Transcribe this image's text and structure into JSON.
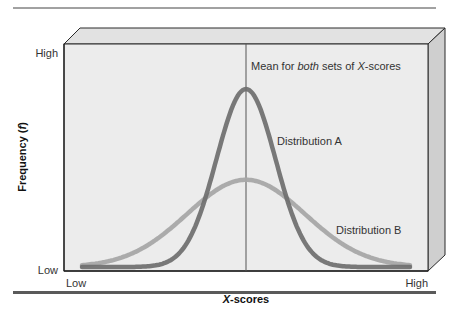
{
  "figure": {
    "top_rule": true,
    "bottom_rule": true
  },
  "chart_data": {
    "type": "line",
    "title": "",
    "xlabel": "X-scores",
    "xlabel_italic_part": "X",
    "xlabel_rest": "-scores",
    "ylabel": "Frequency (f)",
    "ylabel_prefix": "Frequency (",
    "ylabel_italic": "f",
    "ylabel_suffix": ")",
    "x_ticks": [
      "Low",
      "High"
    ],
    "y_ticks": [
      "Low",
      "High"
    ],
    "grid": false,
    "legend_position": "inline annotations",
    "annotations": {
      "mean_line": {
        "text_pre": "Mean for ",
        "text_italic": "both",
        "text_mid": " sets of ",
        "text_italic2": "X",
        "text_post": "-scores",
        "full_text": "Mean for both sets of X-scores",
        "x": 0.5
      }
    },
    "series": [
      {
        "name": "Distribution A",
        "label": "Distribution A",
        "description": "Narrow, tall normal curve (small variability)",
        "mean": 0.5,
        "sd": 0.09,
        "relative_peak": 1.0,
        "color": "#6e6e6e"
      },
      {
        "name": "Distribution B",
        "label": "Distribution B",
        "description": "Wide, short normal curve (large variability)",
        "mean": 0.5,
        "sd": 0.18,
        "relative_peak": 0.49,
        "color": "#a8a8a8"
      }
    ],
    "xlim": [
      0,
      1
    ],
    "ylim": [
      0,
      1
    ]
  },
  "colors": {
    "panel_front": "#ececec",
    "panel_top": "#e2e2e2",
    "panel_side": "#cfcfcf",
    "edge": "#2a2a2a",
    "curve_a": "#6e6e6e",
    "curve_b": "#a8a8a8",
    "rule": "#555555"
  }
}
